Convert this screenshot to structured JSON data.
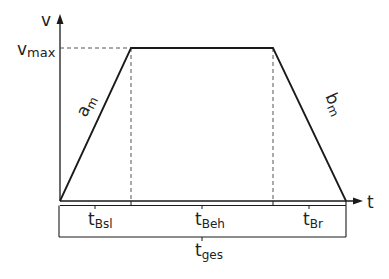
{
  "diagram": {
    "type": "velocity-time trapezoid profile",
    "axes": {
      "y_label": "v",
      "x_label": "t"
    },
    "levels": {
      "vmax_main": "v",
      "vmax_sub": "max"
    },
    "slopes": {
      "accel_main": "a",
      "accel_sub": "m",
      "decel_main": "b",
      "decel_sub": "m"
    },
    "intervals": [
      {
        "main": "t",
        "sub": "Bsl"
      },
      {
        "main": "t",
        "sub": "Beh"
      },
      {
        "main": "t",
        "sub": "Br"
      }
    ],
    "total": {
      "main": "t",
      "sub": "ges"
    },
    "colors": {
      "line": "#1a1a1a",
      "dashed": "#555555",
      "background": "#ffffff"
    }
  }
}
